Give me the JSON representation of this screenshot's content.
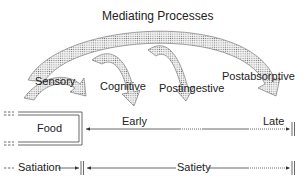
{
  "diagram": {
    "title": "Mediating Processes",
    "processes": [
      {
        "label": "Sensory"
      },
      {
        "label": "Cognitive"
      },
      {
        "label": "Postingestive"
      },
      {
        "label": "Postabsorptive"
      }
    ],
    "food_box": {
      "label": "Food"
    },
    "timeline": {
      "early": "Early",
      "late": "Late"
    },
    "phases": {
      "satiation": "Satiation",
      "satiety": "Satiety"
    }
  }
}
